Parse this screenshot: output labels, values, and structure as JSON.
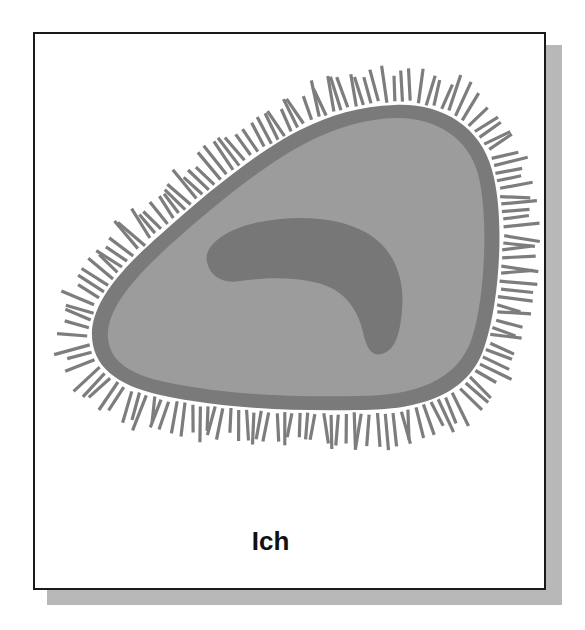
{
  "figure": {
    "label": "Ich",
    "parts": [
      "cilia",
      "membrane",
      "cytoplasm",
      "nucleus"
    ]
  },
  "colors": {
    "frame_border": "#1a1a1a",
    "shadow": "#b8b8b8",
    "membrane": "#7a7a7a",
    "cytoplasm": "#9c9c9c",
    "nucleus": "#777777",
    "cilia": "#7d7d7d",
    "label_text": "#111111"
  }
}
